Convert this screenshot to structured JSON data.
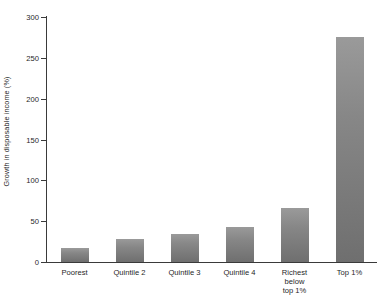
{
  "chart_data": {
    "type": "bar",
    "title": "",
    "subtitle": "",
    "xlabel": "",
    "ylabel": "Growth in disposable income (%)",
    "categories": [
      "Poorest",
      "Quintile 2",
      "Quintile 3",
      "Quintile 4",
      "Richest\nbelow\ntop 1%",
      "Top 1%"
    ],
    "values": [
      17,
      28,
      34,
      43,
      66,
      276
    ],
    "ylim": [
      0,
      300
    ],
    "yticks": [
      0,
      50,
      100,
      150,
      200,
      250,
      300
    ],
    "ytick_labels": [
      "0",
      "50",
      "100",
      "150",
      "200",
      "250",
      "300"
    ],
    "grid": false,
    "legend": null,
    "bar_color": "#8a8a8a",
    "bar_color_top": "#9a9a9a",
    "bar_color_bottom": "#6f6f6f",
    "axis_color": "#3a3a3a",
    "background_color": "#ffffff"
  }
}
